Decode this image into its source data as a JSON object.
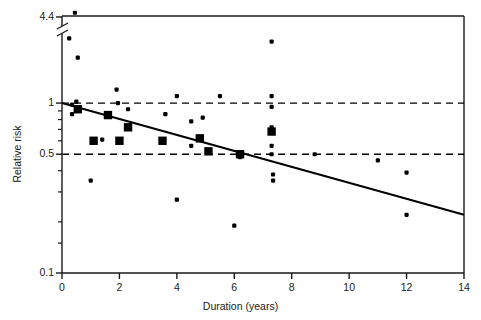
{
  "chart_data": {
    "type": "scatter",
    "title": "",
    "xlabel": "Duration (years)",
    "ylabel": "Relative risk",
    "xlim": [
      0,
      14
    ],
    "ylim": [
      0.1,
      4.4
    ],
    "yscale": "log",
    "y_axis_break": {
      "present": true,
      "between": [
        2.5,
        4.4
      ],
      "note": "axis break drawn just below top label"
    },
    "grid": false,
    "legend": null,
    "xticks": [
      "0",
      "2",
      "4",
      "6",
      "8",
      "10",
      "12",
      "14"
    ],
    "xtick_values": [
      0,
      2,
      4,
      6,
      8,
      10,
      12,
      14
    ],
    "yticks": [
      "4.4",
      "1",
      "0.5",
      "0.1"
    ],
    "ytick_values": [
      4.4,
      1,
      0.5,
      0.1
    ],
    "yminor_ticks": [
      0.9,
      0.8,
      0.7,
      0.6,
      0.4,
      0.3,
      0.2,
      0.15
    ],
    "reference_lines": [
      {
        "name": "null-effect-line",
        "y": 1.0,
        "style": "dashed"
      },
      {
        "name": "lower-reference-line",
        "y": 0.5,
        "style": "dashed"
      }
    ],
    "trend_line": {
      "name": "regression-line",
      "style": "solid",
      "x0": 0.0,
      "y0": 1.0,
      "x1": 14.0,
      "y1": 0.22
    },
    "series": [
      {
        "name": "Individual studies (small)",
        "marker": "small-circle",
        "points": [
          [
            0.45,
            3.4
          ],
          [
            0.25,
            2.4
          ],
          [
            0.55,
            1.85
          ],
          [
            1.9,
            1.2
          ],
          [
            0.5,
            1.02
          ],
          [
            0.35,
            0.98
          ],
          [
            1.95,
            1.0
          ],
          [
            4.0,
            1.1
          ],
          [
            5.5,
            1.1
          ],
          [
            7.3,
            1.1
          ],
          [
            7.3,
            2.3
          ],
          [
            0.35,
            0.86
          ],
          [
            2.3,
            0.92
          ],
          [
            3.6,
            0.86
          ],
          [
            4.5,
            0.78
          ],
          [
            4.9,
            0.82
          ],
          [
            7.3,
            0.95
          ],
          [
            7.3,
            0.72
          ],
          [
            1.4,
            0.61
          ],
          [
            4.5,
            0.56
          ],
          [
            7.3,
            0.56
          ],
          [
            7.3,
            0.5
          ],
          [
            7.35,
            0.38
          ],
          [
            7.35,
            0.35
          ],
          [
            6.2,
            0.48
          ],
          [
            8.8,
            0.5
          ],
          [
            1.0,
            0.35
          ],
          [
            4.0,
            0.27
          ],
          [
            6.0,
            0.19
          ],
          [
            11.0,
            0.46
          ],
          [
            12.0,
            0.39
          ],
          [
            12.0,
            0.22
          ]
        ]
      },
      {
        "name": "Pooled estimates (large)",
        "marker": "large-square",
        "points": [
          [
            0.55,
            0.92
          ],
          [
            1.6,
            0.85
          ],
          [
            2.3,
            0.72
          ],
          [
            1.1,
            0.6
          ],
          [
            2.0,
            0.6
          ],
          [
            3.5,
            0.6
          ],
          [
            4.8,
            0.62
          ],
          [
            5.1,
            0.52
          ],
          [
            6.2,
            0.5
          ],
          [
            7.3,
            0.68
          ]
        ]
      }
    ]
  },
  "figure": {
    "xlabel_text": "Duration (years)",
    "ylabel_text": "Relative risk",
    "ytick_labels": [
      "4.4",
      "1",
      "0.5",
      "0.1"
    ],
    "xtick_labels": [
      "0",
      "2",
      "4",
      "6",
      "8",
      "10",
      "12",
      "14"
    ],
    "colors": {
      "axis": "#1a1a1a",
      "marker": "#000000",
      "trend": "#000000",
      "reference": "#000000",
      "background": "#ffffff"
    }
  }
}
